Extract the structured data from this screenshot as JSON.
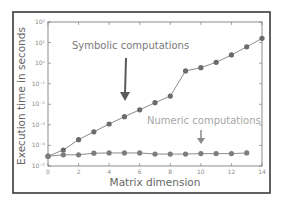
{
  "chart_data": {
    "type": "line",
    "title": "",
    "xlabel": "Matrix dimension",
    "ylabel": "Execution time in seconds",
    "xlim": [
      0,
      14
    ],
    "ylim": [
      1e-05,
      100
    ],
    "yscale": "log",
    "grid": false,
    "legend": "none",
    "x_ticks": [
      0,
      2,
      4,
      6,
      8,
      10,
      12,
      14
    ],
    "x_tick_labels": [
      "0",
      "2",
      "4",
      "6",
      "8",
      "10",
      "12",
      "14"
    ],
    "y_ticks": [
      1e-05,
      0.0001,
      0.001,
      0.01,
      0.1,
      1,
      10,
      100
    ],
    "y_tick_labels": [
      "10⁻⁵",
      "10⁻⁴",
      "10⁻³",
      "10⁻²",
      "10⁻¹",
      "10⁰",
      "10¹",
      "10²"
    ],
    "x": [
      0,
      1,
      2,
      3,
      4,
      5,
      6,
      7,
      8,
      9,
      10,
      11,
      12,
      13,
      14
    ],
    "series": [
      {
        "name": "Symbolic computations",
        "values": [
          3e-05,
          6e-05,
          0.00019,
          0.00046,
          0.0011,
          0.0025,
          0.0054,
          0.012,
          0.025,
          0.42,
          0.6,
          1.1,
          2.5,
          6.2,
          16
        ]
      },
      {
        "name": "Numeric computations",
        "values": [
          3e-05,
          3.5e-05,
          3.5e-05,
          4.2e-05,
          4.3e-05,
          4.3e-05,
          4.3e-05,
          3.8e-05,
          3.8e-05,
          3.8e-05,
          4e-05,
          4e-05,
          4e-05,
          4.3e-05,
          null
        ]
      }
    ],
    "annotations": [
      {
        "text": "Symbolic computations",
        "arrow_to": [
          5,
          0.0025
        ]
      },
      {
        "text": "Numeric computations",
        "arrow_to": [
          10,
          5e-05
        ]
      }
    ]
  },
  "labels": {
    "xlabel": "Matrix dimension",
    "ylabel": "Execution time in seconds",
    "ann_symbolic": "Symbolic computations",
    "ann_numeric": "Numeric computations"
  }
}
